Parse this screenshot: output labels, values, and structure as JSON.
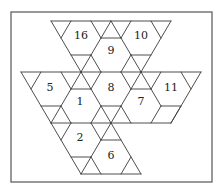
{
  "figure": {
    "frame": {
      "x": 11,
      "y": 12,
      "w": 201,
      "h": 170
    },
    "labels": [
      {
        "text": "16",
        "x": 81,
        "y": 35
      },
      {
        "text": "9",
        "x": 111,
        "y": 50
      },
      {
        "text": "10",
        "x": 141,
        "y": 35
      },
      {
        "text": "5",
        "x": 50,
        "y": 87
      },
      {
        "text": "1",
        "x": 80,
        "y": 101
      },
      {
        "text": "8",
        "x": 111,
        "y": 87
      },
      {
        "text": "7",
        "x": 141,
        "y": 101
      },
      {
        "text": "11",
        "x": 171,
        "y": 87
      },
      {
        "text": "2",
        "x": 80,
        "y": 137
      },
      {
        "text": "6",
        "x": 111,
        "y": 155
      }
    ]
  }
}
